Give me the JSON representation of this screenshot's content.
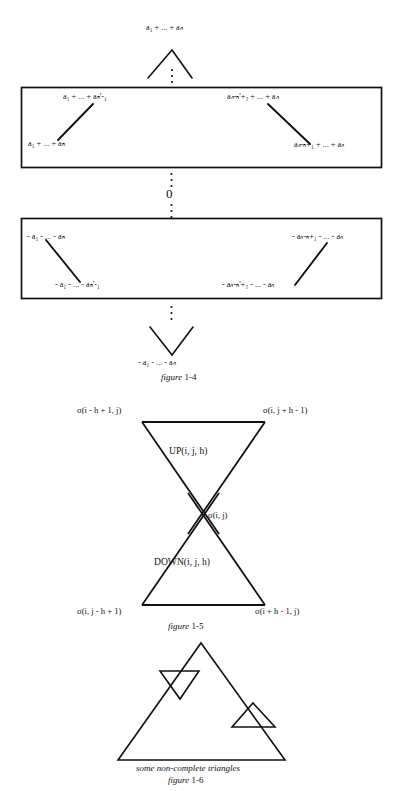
{
  "figure_1_4": {
    "top_label": "a₁ + ... + aₙ",
    "box1": {
      "top_left": "a₁ + ... + aₕ'-₁",
      "bottom_left": "a₁ + ... + aₕ",
      "top_right": "aₙ-ₕ'+₂ + ... + aₙ",
      "bottom_right": "aₙ-ₕ+₁ + ... + aₙ"
    },
    "middle_zero": "0",
    "box2": {
      "top_left": "- a₁ - ... - aₕ",
      "bottom_left": "- a₁ - ... - aₕ'-₁",
      "top_right": "- aₙ-ₕ+₁ - ... - aₙ",
      "bottom_right": "- aₙ-ₕ'+₂ - ... - aₙ"
    },
    "bottom_label": "- a₁ - ... - aₙ",
    "caption_italic": "figure",
    "caption_number": "1-4"
  },
  "figure_1_5": {
    "top_left_vertex": "σ(i - h + 1, j)",
    "top_right_vertex": "σ(i, j + h - 1)",
    "center_vertex": "σ(i, j)",
    "bottom_left_vertex": "σ(i, j - h + 1)",
    "bottom_right_vertex": "σ(i + h - 1, j)",
    "upper_region": "UP(i, j, h)",
    "lower_region": "DOWN(i, j, h)",
    "caption_italic": "figure",
    "caption_number": "1-5"
  },
  "figure_1_6": {
    "caption_text": "some non-complete triangles",
    "caption_italic": "figure",
    "caption_number": "1-6"
  },
  "style": {
    "ink": "#111111",
    "paper": "#ffffff"
  }
}
